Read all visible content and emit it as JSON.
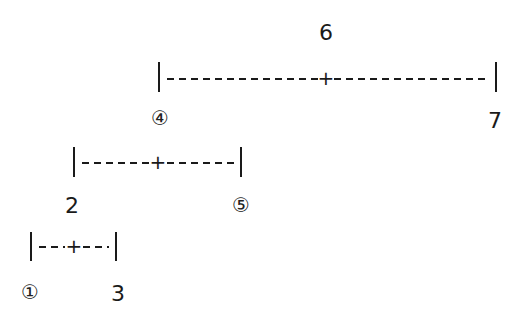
{
  "diagram": {
    "type": "interval-tree",
    "intervals": [
      {
        "id": "top",
        "center_label": "6",
        "left_label": "④",
        "right_label": "7",
        "dashes_left": 12,
        "dashes_right": 12,
        "center_symbol": "+"
      },
      {
        "id": "middle",
        "center_label": "",
        "left_label": "2",
        "right_label": "⑤",
        "dashes_left": 5,
        "dashes_right": 5,
        "center_symbol": "+"
      },
      {
        "id": "bottom",
        "center_label": "",
        "left_label": "①",
        "right_label": "3",
        "dashes_left": 2,
        "dashes_right": 2,
        "center_symbol": "+"
      }
    ]
  },
  "labels": {
    "top_center": "6",
    "top_left": "④",
    "top_right": "7",
    "middle_left": "2",
    "middle_right": "⑤",
    "bottom_left": "①",
    "bottom_right": "3",
    "plus": "+"
  }
}
